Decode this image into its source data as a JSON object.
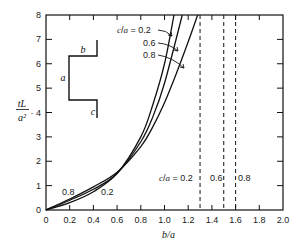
{
  "chart_data": {
    "type": "line",
    "title": "",
    "xlabel": "b/a",
    "ylabel": "tL/a²",
    "xlim": [
      0,
      2.0
    ],
    "ylim": [
      0,
      8
    ],
    "xticks": [
      "0",
      "0.2",
      "0.4",
      "0.6",
      "0.8",
      "1.0",
      "1.2",
      "1.4",
      "1.6",
      "1.8",
      "2.0"
    ],
    "yticks": [
      "0",
      "1",
      "2",
      "3",
      "4",
      "5",
      "6",
      "7",
      "8"
    ],
    "grid": false,
    "legend": "inline annotations with arrows",
    "series": [
      {
        "name": "c/a = 0.2",
        "x": [
          0,
          0.2,
          0.4,
          0.6,
          0.8,
          0.9,
          1.0,
          1.08
        ],
        "y": [
          0,
          0.3,
          0.75,
          1.5,
          3.0,
          4.3,
          6.0,
          8.0
        ]
      },
      {
        "name": "c/a = 0.6",
        "x": [
          0,
          0.2,
          0.4,
          0.6,
          0.8,
          0.9,
          1.0,
          1.15
        ],
        "y": [
          0,
          0.4,
          0.85,
          1.5,
          2.8,
          3.8,
          5.2,
          8.0
        ]
      },
      {
        "name": "c/a = 0.8",
        "x": [
          0,
          0.2,
          0.4,
          0.6,
          0.8,
          0.9,
          1.0,
          1.1,
          1.2,
          1.28
        ],
        "y": [
          0,
          0.45,
          0.95,
          1.55,
          2.6,
          3.4,
          4.4,
          5.6,
          6.9,
          8.0
        ]
      }
    ],
    "asymptotes": [
      {
        "label": "c/a = 0.2",
        "x": 1.3
      },
      {
        "label": "0.6",
        "x": 1.5
      },
      {
        "label": "0.8",
        "x": 1.6
      }
    ],
    "annotations": {
      "legend_title": "c/a = 0.2",
      "legend_items": [
        "0.6",
        "0.8"
      ],
      "low_labels": [
        "0.8",
        "0.2"
      ],
      "asymptote_title": "c/a = 0.2",
      "asymptote_items": [
        "0.6",
        "0.8"
      ],
      "inset_labels": {
        "a": "a",
        "b": "b",
        "c": "c"
      }
    }
  }
}
